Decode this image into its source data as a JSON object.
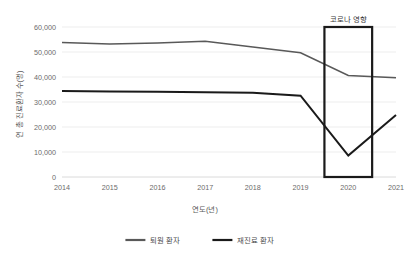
{
  "chart_data": {
    "type": "line",
    "title": "",
    "xlabel": "연도(년)",
    "ylabel": "연 총 진료환자 수(명)",
    "categories": [
      "2014",
      "2015",
      "2016",
      "2017",
      "2018",
      "2019",
      "2020",
      "2021"
    ],
    "x": [
      2014,
      2015,
      2016,
      2017,
      2018,
      2019,
      2020,
      2021
    ],
    "xlim": [
      2014,
      2021
    ],
    "ylim": [
      0,
      60000
    ],
    "yticks": [
      0,
      10000,
      20000,
      30000,
      40000,
      50000,
      60000
    ],
    "ytick_labels": [
      "0",
      "10,000",
      "20,000",
      "30,000",
      "40,000",
      "50,000",
      "60,000"
    ],
    "grid": true,
    "legend_position": "bottom",
    "series": [
      {
        "name": "퇴원 환자",
        "color": "#595959",
        "width": 1.7,
        "values": [
          53800,
          53200,
          53600,
          54300,
          52000,
          49700,
          40600,
          39700
        ]
      },
      {
        "name": "재진료 환자",
        "color": "#1a1a1a",
        "width": 2.0,
        "values": [
          34400,
          34200,
          34100,
          33900,
          33700,
          32500,
          8600,
          24800
        ]
      }
    ],
    "annotations": [
      {
        "name": "covid-impact",
        "label": "코로나 영향",
        "x_start": 2019.5,
        "x_end": 2020.5,
        "y_start": 0,
        "y_end": 60000,
        "color": "#1a1a1a"
      }
    ]
  },
  "legend": {
    "items": [
      {
        "label": "퇴원 환자",
        "color": "#595959"
      },
      {
        "label": "재진료 환자",
        "color": "#1a1a1a"
      }
    ]
  }
}
